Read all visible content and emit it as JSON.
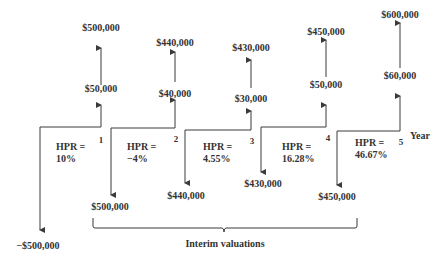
{
  "diagram": {
    "axis_label": "Year",
    "brace_label": "Interim valuations",
    "periods": [
      {
        "year": "1",
        "hpr_label": "HPR =",
        "hpr_value": "10%",
        "outflow": "−$500,000",
        "income": "$50,000",
        "end_value": "$500,000"
      },
      {
        "year": "2",
        "hpr_label": "HPR =",
        "hpr_value": "−4%",
        "outflow": "$500,000",
        "income": "$40,000",
        "end_value": "$440,000"
      },
      {
        "year": "3",
        "hpr_label": "HPR =",
        "hpr_value": "4.55%",
        "outflow": "$440,000",
        "income": "$30,000",
        "end_value": "$430,000"
      },
      {
        "year": "4",
        "hpr_label": "HPR =",
        "hpr_value": "16.28%",
        "outflow": "$430,000",
        "income": "$50,000",
        "end_value": "$450,000"
      },
      {
        "year": "5",
        "hpr_label": "HPR =",
        "hpr_value": "46.67%",
        "outflow": "$450,000",
        "income": "$60,000",
        "end_value": "$600,000"
      }
    ]
  }
}
